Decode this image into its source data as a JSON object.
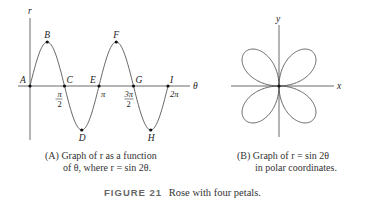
{
  "chart_data": [
    {
      "type": "line",
      "title": "(A) Graph of r as a function of θ, where r = sin 2θ.",
      "xlabel": "θ",
      "ylabel": "r",
      "function": "r = sin 2θ",
      "xlim": [
        0,
        6.2832
      ],
      "ylim": [
        -1,
        1
      ],
      "x_ticks": [
        {
          "value": 1.5708,
          "label_top": "π",
          "label_bottom": "2"
        },
        {
          "value": 3.1416,
          "label_top": "π",
          "label_bottom": ""
        },
        {
          "value": 4.7124,
          "label_top": "3π",
          "label_bottom": "2"
        },
        {
          "value": 6.2832,
          "label_top": "2π",
          "label_bottom": ""
        }
      ],
      "points": [
        {
          "label": "A",
          "theta": 0,
          "r": 0
        },
        {
          "label": "B",
          "theta": 0.7854,
          "r": 1
        },
        {
          "label": "C",
          "theta": 1.5708,
          "r": 0
        },
        {
          "label": "D",
          "theta": 2.3562,
          "r": -1
        },
        {
          "label": "E",
          "theta": 3.1416,
          "r": 0
        },
        {
          "label": "F",
          "theta": 3.927,
          "r": 1
        },
        {
          "label": "G",
          "theta": 4.7124,
          "r": 0
        },
        {
          "label": "H",
          "theta": 5.4978,
          "r": -1
        },
        {
          "label": "I",
          "theta": 6.2832,
          "r": 0
        }
      ],
      "grid": false
    },
    {
      "type": "line",
      "title": "(B) Graph of r = sin 2θ in polar coordinates.",
      "coordinate_system": "polar",
      "function": "r = sin 2θ",
      "xlabel": "x",
      "ylabel": "y",
      "theta_range": [
        0,
        6.2832
      ],
      "petals": 4,
      "grid": false
    }
  ],
  "panel_a": {
    "axis_r": "r",
    "axis_theta": "θ",
    "caption_line1": "(A) Graph of r as a function",
    "caption_line2": "of θ, where r = sin 2θ."
  },
  "panel_b": {
    "axis_x": "x",
    "axis_y": "y",
    "caption_line1": "(B) Graph of r = sin 2θ",
    "caption_line2": "in polar coordinates."
  },
  "figure": {
    "number": "FIGURE 21",
    "title": "Rose with four petals."
  },
  "colors": {
    "curve": "#555555",
    "axis": "#444444",
    "text": "#222222",
    "figure_number": "#666666"
  }
}
